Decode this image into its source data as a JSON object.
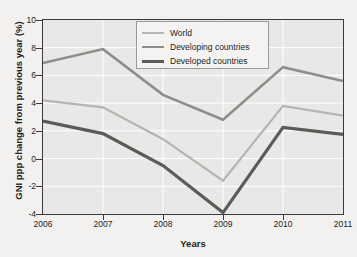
{
  "chart_data": {
    "type": "line",
    "title": "",
    "xlabel": "Years",
    "ylabel": "GNI ppp change from previous year (%)",
    "x": [
      2006,
      2007,
      2008,
      2009,
      2010,
      2011
    ],
    "xticklabels": [
      "2006",
      "2007",
      "2008",
      "2009",
      "2010",
      "2011"
    ],
    "yticklabels": [
      "10",
      "8",
      "6",
      "4",
      "2",
      "0",
      "-2",
      "-4"
    ],
    "yticks": [
      10,
      8,
      6,
      4,
      2,
      0,
      -2,
      -4
    ],
    "xlim": [
      2006,
      2011
    ],
    "ylim": [
      -4,
      10
    ],
    "grid": true,
    "legend_position": "top-center",
    "series": [
      {
        "name": "World",
        "color": "#b5b4b2",
        "values": [
          4.2,
          3.7,
          1.4,
          -1.6,
          3.8,
          3.1
        ]
      },
      {
        "name": "Developing countries",
        "color": "#8e8d8b",
        "values": [
          6.9,
          7.9,
          4.6,
          2.8,
          6.6,
          5.6
        ]
      },
      {
        "name": "Developed countries",
        "color": "#5c5b59",
        "values": [
          2.7,
          1.8,
          -0.5,
          -3.9,
          2.25,
          1.75
        ]
      }
    ]
  },
  "legend": {
    "items": [
      {
        "label": "World",
        "color": "#b5b4b2",
        "width": 2.2
      },
      {
        "label": "Developing countries",
        "color": "#8e8d8b",
        "width": 2.6
      },
      {
        "label": "Developed countries",
        "color": "#5c5b59",
        "width": 3.2
      }
    ]
  },
  "axes": {
    "background": "#e9e8e6",
    "gridline_color": "#ffffff",
    "frame_color": "#3a3a3a"
  },
  "page": {
    "background": "#f2f1ef"
  }
}
